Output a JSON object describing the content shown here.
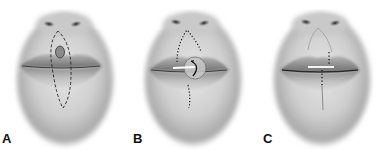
{
  "figure": {
    "panels": [
      {
        "label": "A",
        "step": "dashed elliptical incision outline around lesion on upper lip extending to chin"
      },
      {
        "label": "B",
        "step": "sutured flap with rotation arrow across vermilion"
      },
      {
        "label": "C",
        "step": "final closure with sutures along midline"
      }
    ]
  },
  "colors": {
    "background": "#ffffff",
    "skin_light": "#e8e8e8",
    "skin_dark": "#9a9a9a",
    "lip": "#8c8c8c",
    "line": "#222222"
  }
}
